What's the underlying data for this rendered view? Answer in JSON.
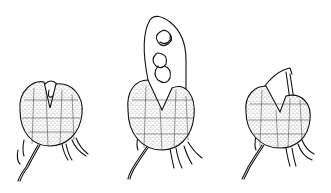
{
  "figure": {
    "background": "#ffffff",
    "ink": "#111111",
    "specimens": [
      {
        "label": "left",
        "state": "split with small loop emerging"
      },
      {
        "label": "middle",
        "state": "split with elongated sac containing coils"
      },
      {
        "label": "right",
        "state": "split with hooked thread emerging"
      }
    ]
  }
}
